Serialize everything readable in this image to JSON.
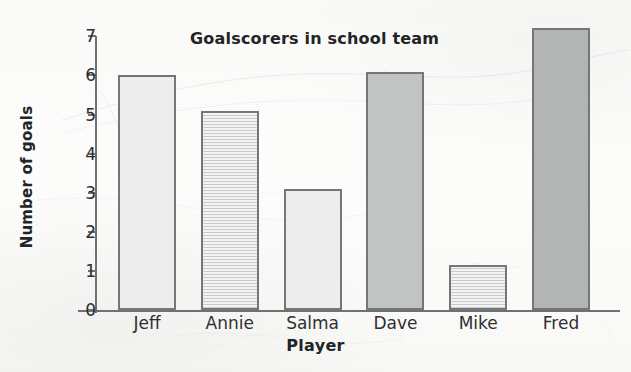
{
  "chart_data": {
    "type": "bar",
    "title": "Goalscorers in school team",
    "xlabel": "Player",
    "ylabel": "Number of goals",
    "categories": [
      "Jeff",
      "Annie",
      "Salma",
      "Dave",
      "Mike",
      "Fred"
    ],
    "values": [
      6,
      5.1,
      3.1,
      6.1,
      1.15,
      7.2
    ],
    "ylim": [
      0,
      7
    ],
    "yticks": [
      0,
      1,
      2,
      3,
      4,
      5,
      6,
      7
    ],
    "ytick_labels": [
      "0",
      "1",
      "2",
      "3",
      "4",
      "5",
      "6",
      "7"
    ],
    "grid": false,
    "legend": "none",
    "bar_styles": [
      "plain-light",
      "hatch",
      "plain-light",
      "plain-mid",
      "hatch",
      "plain-dark"
    ],
    "colors": {
      "bar_light": "#ecedec",
      "bar_mid": "#c2c4c3",
      "bar_dark": "#b3b5b4",
      "bar_hatch_bg": "#f3f4f3",
      "bar_outline": "#74777a",
      "axis": "#6f7271",
      "text": "#232426",
      "paper": "#fdfdfc"
    }
  }
}
